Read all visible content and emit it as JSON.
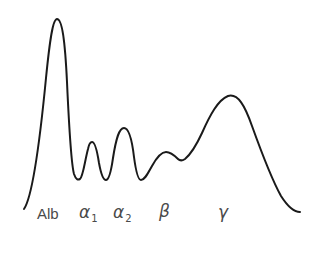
{
  "figure": {
    "kind": "serum-protein-electrophoresis-densitometry-trace",
    "background_color": "#ffffff",
    "curve_color": "#1a1a1a",
    "curve_width": 2,
    "label_color": "#4a4a4a"
  },
  "labels": {
    "albumin": "Alb",
    "alpha1_base": "α",
    "alpha1_sub": "1",
    "alpha2_base": "α",
    "alpha2_sub": "2",
    "beta": "β",
    "gamma": "γ"
  },
  "chart_data": {
    "type": "line",
    "title": "",
    "xlabel": "",
    "ylabel": "",
    "grid": false,
    "legend": "none",
    "axis_visible": false,
    "xlim": [
      0,
      326
    ],
    "ylim": [
      259,
      0
    ],
    "categories": [
      "Alb",
      "α1",
      "α2",
      "β",
      "γ"
    ],
    "peak_labels_x": [
      55,
      91,
      124,
      166,
      228
    ],
    "peak_apex_y": [
      19,
      142,
      128,
      152,
      96
    ],
    "peak_heights_relative": [
      1.0,
      0.35,
      0.43,
      0.3,
      0.6
    ],
    "valleys_x": [
      79,
      106,
      140,
      180
    ],
    "valleys_y": [
      179,
      180,
      180,
      161
    ],
    "baseline_start": [
      24,
      209
    ],
    "baseline_end": [
      300,
      212
    ],
    "path": "M24,209 C33,196 40,140 46,78 C50,38 53,19 57,19 C62,19 65,40 67,82 C69,126 71,163 74,174 C76,180 78,180 80,179 C83,177 85,160 88,149 C89,144 90,142 92,142 C95,142 97,150 99,163 C101,174 103,180 106,180 C109,180 111,172 113,158 C116,139 119,128 124,128 C129,128 132,140 134,157 C136,172 138,180 141,180 C145,180 148,173 152,166 C157,157 161,152 166,152 C171,152 175,156 178,159 C180,161 182,161 185,159 C191,154 196,146 202,133 C210,115 218,100 228,96 C238,93 245,106 252,126 C261,151 271,178 281,196 C288,207 294,212 300,212"
  }
}
